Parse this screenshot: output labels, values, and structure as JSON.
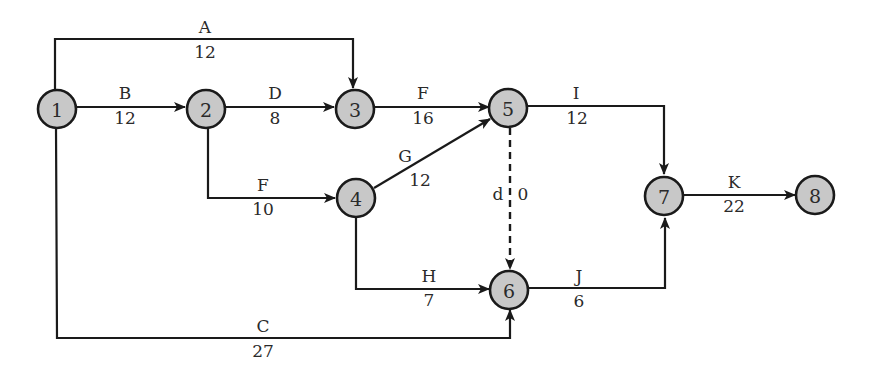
{
  "diagram": {
    "type": "activity-on-arrow network",
    "nodes": [
      {
        "id": "1",
        "label": "1"
      },
      {
        "id": "2",
        "label": "2"
      },
      {
        "id": "3",
        "label": "3"
      },
      {
        "id": "4",
        "label": "4"
      },
      {
        "id": "5",
        "label": "5"
      },
      {
        "id": "6",
        "label": "6"
      },
      {
        "id": "7",
        "label": "7"
      },
      {
        "id": "8",
        "label": "8"
      }
    ],
    "edges": [
      {
        "activity": "A",
        "duration": "12",
        "from": "1",
        "to": "3"
      },
      {
        "activity": "B",
        "duration": "12",
        "from": "1",
        "to": "2"
      },
      {
        "activity": "C",
        "duration": "27",
        "from": "1",
        "to": "6"
      },
      {
        "activity": "D",
        "duration": "8",
        "from": "2",
        "to": "3"
      },
      {
        "activity": "F",
        "duration": "10",
        "from": "2",
        "to": "4"
      },
      {
        "activity": "F",
        "duration": "16",
        "from": "3",
        "to": "5"
      },
      {
        "activity": "G",
        "duration": "12",
        "from": "4",
        "to": "5"
      },
      {
        "activity": "H",
        "duration": "7",
        "from": "4",
        "to": "6"
      },
      {
        "activity": "d",
        "duration": "0",
        "from": "5",
        "to": "6",
        "dummy": true
      },
      {
        "activity": "I",
        "duration": "12",
        "from": "5",
        "to": "7"
      },
      {
        "activity": "J",
        "duration": "6",
        "from": "6",
        "to": "7"
      },
      {
        "activity": "K",
        "duration": "22",
        "from": "7",
        "to": "8"
      }
    ]
  }
}
